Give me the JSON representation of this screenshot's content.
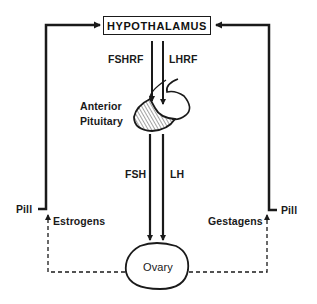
{
  "diagram": {
    "nodes": {
      "hypothalamus": "HYPOTHALAMUS",
      "anterior_pituitary_line1": "Anterior",
      "anterior_pituitary_line2": "Pituitary",
      "ovary": "Ovary"
    },
    "edge_labels": {
      "fshrf": "FSHRF",
      "lhrf": "LHRF",
      "fsh": "FSH",
      "lh": "LH",
      "estrogens": "Estrogens",
      "gestagens": "Gestagens",
      "pill_left": "Pill",
      "pill_right": "Pill"
    },
    "edges": [
      {
        "from": "Hypothalamus",
        "to": "Anterior Pituitary",
        "label": "FSHRF",
        "style": "solid"
      },
      {
        "from": "Hypothalamus",
        "to": "Anterior Pituitary",
        "label": "LHRF",
        "style": "solid"
      },
      {
        "from": "Anterior Pituitary",
        "to": "Ovary",
        "label": "FSH",
        "style": "solid"
      },
      {
        "from": "Anterior Pituitary",
        "to": "Ovary",
        "label": "LH",
        "style": "solid"
      },
      {
        "from": "Ovary",
        "to": "Hypothalamus",
        "label": "Estrogens",
        "style": "dashed"
      },
      {
        "from": "Ovary",
        "to": "Hypothalamus",
        "label": "Gestagens",
        "style": "dashed"
      },
      {
        "from": "Pill",
        "to": "Hypothalamus",
        "label": "Pill",
        "style": "solid",
        "side": "left"
      },
      {
        "from": "Pill",
        "to": "Hypothalamus",
        "label": "Pill",
        "style": "solid",
        "side": "right"
      }
    ],
    "colors": {
      "ink": "#1a1a1a",
      "background": "#ffffff"
    }
  }
}
